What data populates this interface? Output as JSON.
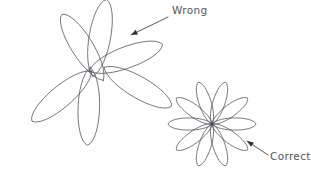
{
  "figure": {
    "background_color": "#fefefe",
    "stroke_color": "#4a4a52",
    "text_color": "#55555c",
    "width": 311,
    "height": 174
  },
  "annotations": [
    {
      "id": "wrong",
      "label": "Wrong",
      "text_x": 172,
      "text_y": 14,
      "arrow_tail_x": 168,
      "arrow_tail_y": 17,
      "arrow_tip_x": 131,
      "arrow_tip_y": 35,
      "points_to": "left-flower-petal-upper-right"
    },
    {
      "id": "correct",
      "label": "Correct",
      "text_x": 270,
      "text_y": 160,
      "arrow_tail_x": 268,
      "arrow_tail_y": 155,
      "arrow_tip_x": 247,
      "arrow_tip_y": 141,
      "points_to": "right-flower-petal-lower-right"
    }
  ],
  "flowers": [
    {
      "id": "left-flower",
      "status": "wrong",
      "description": "Petal curves do not converge at a single center point; loops cross at offset positions forming a tangled hub.",
      "center_x": 95,
      "center_y": 74,
      "petal_count": 6,
      "petal_length": 78,
      "petal_width": 30,
      "converges_at_center": false,
      "center_offset_spread": 9,
      "petal_angles_deg": [
        -122,
        -80,
        -20,
        30,
        92,
        140
      ]
    },
    {
      "id": "right-flower",
      "status": "correct",
      "description": "All petal curves meet exactly at one common center point.",
      "center_x": 212,
      "center_y": 124,
      "petal_count": 10,
      "petal_length": 44,
      "petal_width": 17,
      "converges_at_center": true,
      "center_offset_spread": 0,
      "petal_angles_deg": [
        0,
        36,
        72,
        108,
        144,
        180,
        216,
        252,
        288,
        324
      ]
    }
  ]
}
